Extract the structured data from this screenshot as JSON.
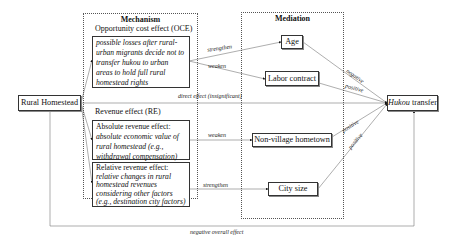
{
  "diagram": {
    "source_node": {
      "label": "Rural Homestead"
    },
    "target_node": {
      "label_italic": "Hukou",
      "label_rest": " transfer"
    },
    "mechanism": {
      "title": "Mechanism",
      "oce": {
        "heading": "Opportunity cost effect (OCE)",
        "lines": [
          "possible losses after rural-",
          "urban migrants decide not to",
          "transfer hukou to urban",
          "areas to hold full rural",
          "homestead rights"
        ]
      },
      "re": {
        "heading": "Revenue effect (RE)",
        "absolute": {
          "heading": "Absolute revenue effect:",
          "lines": [
            "absolute economic value of",
            "rural homestead (e.g.,",
            "withdrawal compensation)"
          ]
        },
        "relative": {
          "heading": "Relative revenue effect:",
          "lines": [
            "relative changes in rural",
            "homestead revenues",
            "considering other factors",
            "(e.g., destination city factors)"
          ]
        }
      }
    },
    "mediation": {
      "title": "Mediation",
      "nodes": [
        {
          "label": "Age"
        },
        {
          "label": "Labor contract"
        },
        {
          "label": "Non-village hometown"
        },
        {
          "label": "City size"
        }
      ]
    },
    "edge_labels": {
      "oce_to_age": "strengthen",
      "oce_to_labor": "weaken",
      "abs_to_nonvillage": "weaken",
      "rel_to_citysize": "strengthen",
      "age_to_hukou": "negative",
      "labor_to_hukou": "positive",
      "nonvillage_to_hukou": "positive",
      "citysize_to_hukou": "positive",
      "direct": "direct effect (insignificant)",
      "overall": "negative overall effect"
    }
  }
}
